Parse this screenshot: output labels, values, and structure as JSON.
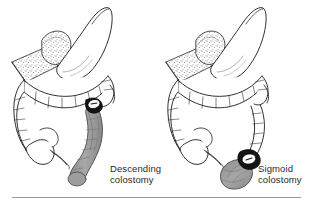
{
  "illustration": {
    "title": "Colostomy sites on the large intestine",
    "type": "line-drawing",
    "background_color": "#ffffff",
    "ink_color": "#1a1a1a",
    "shaded_colon_color": "#9d9d9d",
    "stoma_ring_color": "#111111",
    "stoma_center_color": "#ffffff",
    "panel_count": 2
  },
  "panels": [
    {
      "id": "descending",
      "caption_line1": "Descending",
      "caption_line2": "colostomy",
      "caption": "Descending\ncolostomy",
      "shaded_segment": "descending colon",
      "stoma_location": "upper descending colon",
      "structures": [
        "stomach",
        "greater omentum",
        "transverse colon",
        "ascending colon",
        "cecum",
        "appendix",
        "descending colon",
        "sigmoid colon",
        "stoma"
      ]
    },
    {
      "id": "sigmoid",
      "caption_line1": "Sigmoid",
      "caption_line2": "colostomy",
      "caption": "Sigmoid\ncolostomy",
      "shaded_segment": "sigmoid colon",
      "stoma_location": "sigmoid colon",
      "structures": [
        "stomach",
        "greater omentum",
        "transverse colon",
        "ascending colon",
        "cecum",
        "appendix",
        "descending colon",
        "sigmoid colon",
        "stoma"
      ]
    }
  ],
  "footer": {
    "rule_visible": true,
    "rule_color": "#9a9a9a"
  }
}
